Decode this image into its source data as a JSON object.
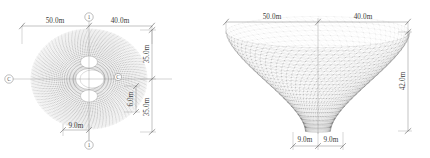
{
  "drawing": {
    "title": "Hyperboloid lattice shell structure - plan and elevation",
    "line_color": "#6b6b6b",
    "mesh_color": "#555555",
    "dim_color": "#7c7c7c",
    "background": "#ffffff"
  },
  "plan_view": {
    "name": "plan-view",
    "dimensions": {
      "top_left": "50.0m",
      "top_right": "40.0m",
      "right_upper": "35.0m",
      "right_inner": "6.0m",
      "right_lower": "35.0m",
      "bottom_left": "9.0m"
    },
    "grid_bubbles": {
      "top": "1",
      "left": "C",
      "right": "C",
      "bottom": "1"
    }
  },
  "elevation_view": {
    "name": "elevation-view",
    "dimensions": {
      "top_left": "50.0m",
      "top_right": "40.0m",
      "right_height": "42.0m",
      "bottom_left": "9.0m",
      "bottom_right": "9.0m"
    }
  }
}
